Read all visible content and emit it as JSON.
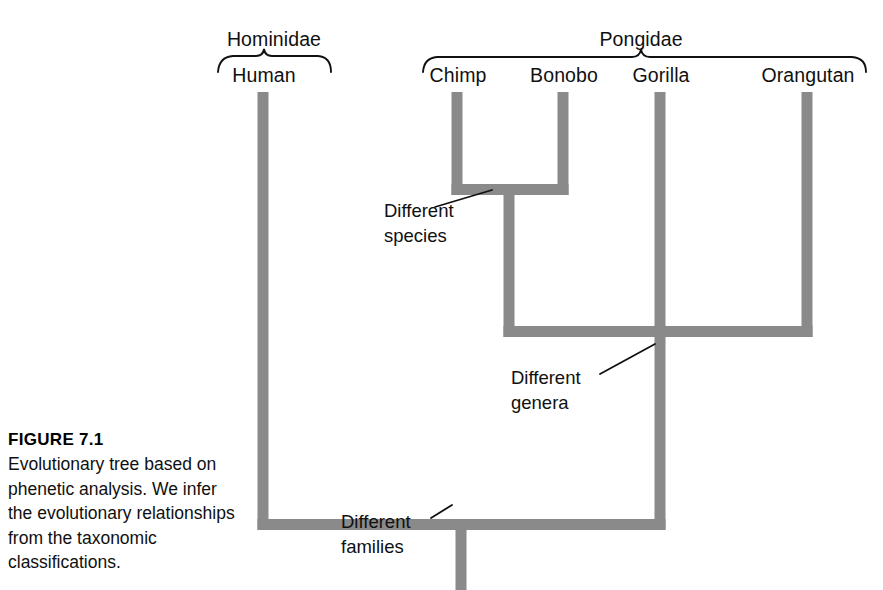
{
  "figure": {
    "caption_title": "FIGURE 7.1",
    "caption_body": "Evolutionary tree based on phenetic analysis. We infer the evolutionary relationships from the taxonomic classifications."
  },
  "groups": [
    {
      "id": "hominidae",
      "label": "Hominidae",
      "x": 274,
      "y": 44,
      "brace_left": 218,
      "brace_right": 331,
      "brace_apex": 264
    },
    {
      "id": "pongidae",
      "label": "Pongidae",
      "x": 641,
      "y": 44,
      "brace_left": 423,
      "brace_right": 866,
      "brace_apex": 641
    }
  ],
  "tips": [
    {
      "id": "human",
      "label": "Human",
      "x": 264,
      "y": 74,
      "stem_x": 263
    },
    {
      "id": "chimp",
      "label": "Chimp",
      "x": 458,
      "y": 74,
      "stem_x": 457
    },
    {
      "id": "bonobo",
      "label": "Bonobo",
      "x": 564,
      "y": 74,
      "stem_x": 563
    },
    {
      "id": "gorilla",
      "label": "Gorilla",
      "x": 661,
      "y": 74,
      "stem_x": 660
    },
    {
      "id": "orangutan",
      "label": "Orangutan",
      "x": 808,
      "y": 74,
      "stem_x": 807
    }
  ],
  "annotations": [
    {
      "id": "different-species",
      "text": "Different\nspecies",
      "x": 384,
      "y": 198,
      "leader": {
        "x1": 435,
        "y1": 207,
        "x2": 492,
        "y2": 190
      }
    },
    {
      "id": "different-genera",
      "text": "Different\ngenera",
      "x": 511,
      "y": 365,
      "leader": {
        "x1": 600,
        "y1": 374,
        "x2": 655,
        "y2": 344
      }
    },
    {
      "id": "different-families",
      "text": "Different\nfamilies",
      "x": 341,
      "y": 509,
      "leader": {
        "x1": 431,
        "y1": 518,
        "x2": 452,
        "y2": 505
      }
    }
  ],
  "tree": {
    "branch_color": "#8a8a8a",
    "line_color": "#111111",
    "stem_width": 11,
    "nodes": [
      {
        "id": "pan-clade",
        "label": "Chimp + Bonobo ancestor",
        "y": 189,
        "stem_x": 509,
        "left_x": 457,
        "right_x": 563
      },
      {
        "id": "pongid-clade",
        "label": "Pongidae ancestor",
        "y": 331,
        "stem_x": 660,
        "left_x": 509,
        "right_x": 807
      },
      {
        "id": "root",
        "label": "Common ancestor",
        "y": 524,
        "stem_x": 461,
        "left_x": 263,
        "right_x": 660,
        "root_bottom": 590
      }
    ]
  }
}
